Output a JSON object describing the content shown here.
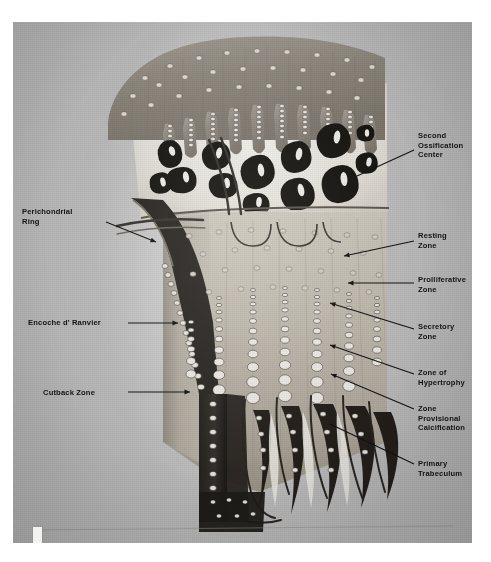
{
  "figure": {
    "kind": "anatomical-illustration",
    "signature": "Sanderson '73"
  },
  "labels": {
    "right": [
      {
        "id": "second-ossification-center",
        "text": "Second\nOssification\nCenter",
        "x": 418,
        "y": 131,
        "leader": {
          "x1": 414,
          "y1": 150,
          "x2": 357,
          "y2": 176,
          "arrow": false
        }
      },
      {
        "id": "resting-zone",
        "text": "Resting\nZone",
        "x": 418,
        "y": 231,
        "leader": {
          "x1": 414,
          "y1": 241,
          "x2": 344,
          "y2": 256,
          "arrow": true
        }
      },
      {
        "id": "proliferative-zone",
        "text": "Prolliferative\nZone",
        "x": 418,
        "y": 275,
        "leader": {
          "x1": 414,
          "y1": 283,
          "x2": 348,
          "y2": 283,
          "arrow": true
        }
      },
      {
        "id": "secretory-zone",
        "text": "Secretory\nZone",
        "x": 418,
        "y": 322,
        "leader": {
          "x1": 414,
          "y1": 329,
          "x2": 330,
          "y2": 303,
          "arrow": true
        }
      },
      {
        "id": "zone-of-hypertrophy",
        "text": "Zone of\nHypertrophy",
        "x": 418,
        "y": 368,
        "leader": {
          "x1": 414,
          "y1": 374,
          "x2": 330,
          "y2": 345,
          "arrow": true
        }
      },
      {
        "id": "zone-provisional-calcification",
        "text": "Zone\nProvisional\nCalcification",
        "x": 418,
        "y": 404,
        "leader": {
          "x1": 414,
          "y1": 409,
          "x2": 331,
          "y2": 374,
          "arrow": true
        }
      },
      {
        "id": "primary-trabeculum",
        "text": "Primary\nTrabeculum",
        "x": 418,
        "y": 459,
        "leader": {
          "x1": 414,
          "y1": 464,
          "x2": 330,
          "y2": 424,
          "arrow": false
        }
      }
    ],
    "left": [
      {
        "id": "perichondrial-ring",
        "text": "Perichondrial\nRing",
        "x": 22,
        "y": 207,
        "leader": {
          "x1": 106,
          "y1": 222,
          "x2": 156,
          "y2": 242,
          "arrow": true
        }
      },
      {
        "id": "encoche-d-ranvier",
        "text": "Encoche d' Ranvier",
        "x": 28,
        "y": 318,
        "leader": {
          "x1": 128,
          "y1": 323,
          "x2": 178,
          "y2": 323,
          "arrow": true
        }
      },
      {
        "id": "cutback-zone",
        "text": "Cutback Zone",
        "x": 43,
        "y": 388,
        "leader": {
          "x1": 128,
          "y1": 392,
          "x2": 190,
          "y2": 392,
          "arrow": true
        }
      }
    ]
  },
  "palette": {
    "page": "#ffffff",
    "plate": "#bfbfbf",
    "cartilage_light": "#dcd9d2",
    "cartilage_mid": "#b9b4aa",
    "cartilage_dark": "#8e887d",
    "bone_dark": "#1d1b19",
    "marrow_white": "#f4f2ee",
    "vessel": "#2b2926",
    "label_text": "#141414"
  }
}
